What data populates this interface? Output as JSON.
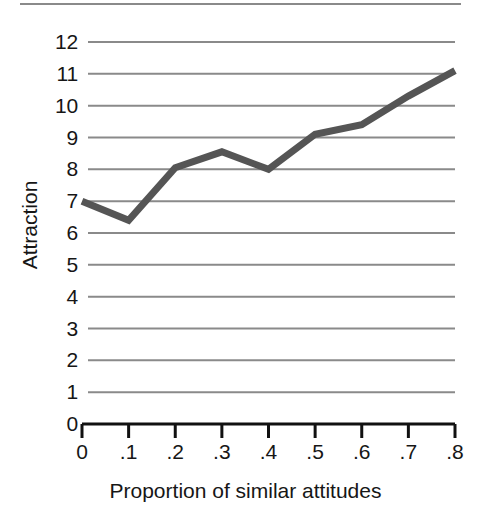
{
  "figure": {
    "background_color": "#ffffff",
    "top_rule": true
  },
  "chart_data": {
    "type": "line",
    "title": "",
    "xlabel": "Proportion of similar attitudes",
    "ylabel": "Attraction",
    "x": [
      0,
      0.1,
      0.2,
      0.3,
      0.4,
      0.5,
      0.6,
      0.7,
      0.8
    ],
    "x_tick_labels": [
      "0",
      ".1",
      ".2",
      ".3",
      ".4",
      ".5",
      ".6",
      ".7",
      ".8"
    ],
    "y_tick_labels": [
      "0",
      "1",
      "2",
      "3",
      "4",
      "5",
      "6",
      "7",
      "8",
      "9",
      "10",
      "11",
      "12"
    ],
    "y_ticks": [
      0,
      1,
      2,
      3,
      4,
      5,
      6,
      7,
      8,
      9,
      10,
      11,
      12
    ],
    "xlim": [
      0,
      0.8
    ],
    "ylim": [
      0,
      12
    ],
    "grid": "horizontal",
    "grid_color": "#8a8a8a",
    "legend": "none",
    "series": [
      {
        "name": "Attraction",
        "color": "#555555",
        "line_width": 7,
        "values": [
          7.0,
          6.4,
          8.05,
          8.55,
          8.0,
          9.1,
          9.4,
          10.3,
          11.1
        ]
      }
    ]
  },
  "axis": {
    "line_color": "#111111",
    "tick_direction": "down"
  }
}
